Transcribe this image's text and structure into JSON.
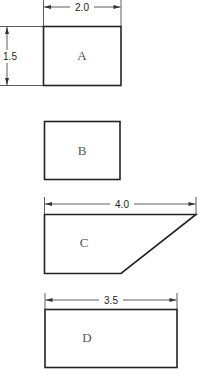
{
  "diagram": {
    "shapes": [
      {
        "id": "A",
        "label": "A",
        "kind": "rectangle",
        "width_dim": "2.0",
        "height_dim": "1.5"
      },
      {
        "id": "B",
        "label": "B",
        "kind": "rectangle"
      },
      {
        "id": "C",
        "label": "C",
        "kind": "trapezoid",
        "width_dim": "4.0"
      },
      {
        "id": "D",
        "label": "D",
        "kind": "rectangle",
        "width_dim": "3.5"
      }
    ],
    "colors": {
      "stroke": "#222222",
      "label": "#555555",
      "background": "#ffffff"
    }
  }
}
